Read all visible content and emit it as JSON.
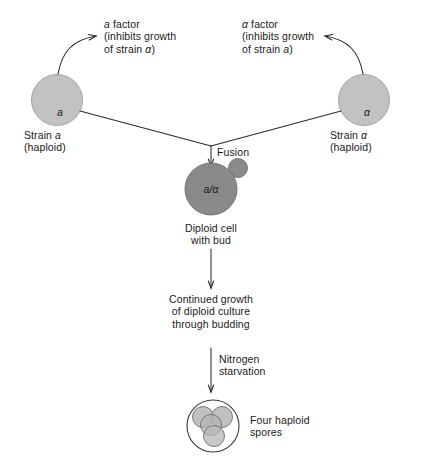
{
  "figure": {
    "colors": {
      "haploid_fill": "#c2c2c2",
      "haploid_stroke": "#9a9a9a",
      "diploid_fill": "#8a8a8a",
      "diploid_stroke": "#6e6e6e",
      "spore_fill": "#b5b5b5",
      "spore_stroke": "#6e6e6e",
      "ascus_stroke": "#3a3a3a",
      "line": "#2b2b2b",
      "text": "#1a1a1a",
      "background": "#ffffff"
    }
  },
  "left_cell": {
    "glyph": "a",
    "label_line1": "Strain a",
    "label_line1_plain": "Strain",
    "label_line1_italic": "a",
    "label_line2": "(haploid)"
  },
  "right_cell": {
    "glyph": "α",
    "label_line1_plain": "Strain",
    "label_line1_italic": "α",
    "label_line2": "(haploid)"
  },
  "left_factor": {
    "line1_italic": "a",
    "line1_plain": " factor",
    "line2": "(inhibits growth",
    "line3_plain": "of strain ",
    "line3_italic": "α",
    "line3_tail": ")"
  },
  "right_factor": {
    "line1_italic": "α",
    "line1_plain": " factor",
    "line2": "(inhibits growth",
    "line3_plain": "of strain ",
    "line3_italic": "a",
    "line3_tail": ")"
  },
  "fusion": {
    "label": "Fusion"
  },
  "diploid": {
    "glyph_a": "a",
    "glyph_slash": "/",
    "glyph_alpha": "α",
    "label_line1": "Diploid cell",
    "label_line2": "with bud"
  },
  "growth": {
    "line1": "Continued growth",
    "line2": "of diploid culture",
    "line3": "through budding"
  },
  "starvation": {
    "line1": "Nitrogen",
    "line2": "starvation"
  },
  "spores": {
    "label_line1": "Four haploid",
    "label_line2": "spores",
    "count": 4
  }
}
